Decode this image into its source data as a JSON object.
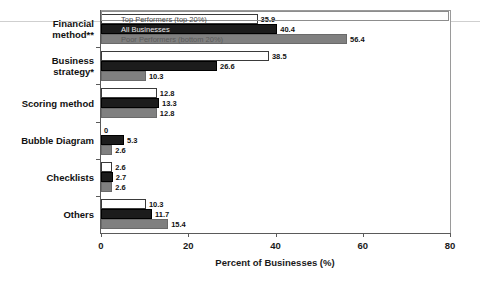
{
  "chart_data": {
    "type": "bar",
    "orientation": "horizontal",
    "title": "",
    "xlabel": "Percent of Businesses (%)",
    "ylabel": "",
    "xlim": [
      0,
      80
    ],
    "xticks": [
      "0",
      "20",
      "40",
      "60",
      "80"
    ],
    "grid": false,
    "legend_position": "inside-top-bars",
    "categories": [
      "Financial method**",
      "Business strategy*",
      "Scoring method",
      "Bubble Diagram",
      "Checklists",
      "Others"
    ],
    "series": [
      {
        "name": "Top Performers (top 20%)",
        "color": "#ffffff",
        "values": [
          35.9,
          38.5,
          12.8,
          0,
          2.6,
          10.3
        ],
        "value_labels": [
          "35.9",
          "38.5",
          "12.8",
          "0",
          "2.6",
          "10.3"
        ]
      },
      {
        "name": "All Businesses",
        "color": "#1c1c1c",
        "values": [
          40.4,
          26.6,
          13.3,
          5.3,
          2.7,
          11.7
        ],
        "value_labels": [
          "40.4",
          "26.6",
          "13.3",
          "5.3",
          "2.7",
          "11.7"
        ]
      },
      {
        "name": "Poor Performers (bottom 20%)",
        "color": "#808080",
        "values": [
          56.4,
          10.3,
          12.8,
          2.6,
          2.6,
          15.4
        ],
        "value_labels": [
          "56.4",
          "10.3",
          "12.8",
          "2.6",
          "2.6",
          "15.4"
        ]
      }
    ]
  },
  "legend": {
    "entries": [
      "Top Performers (top 20%)",
      "All Businesses",
      "Poor Performers (bottom 20%)"
    ]
  },
  "axis": {
    "x_title": "Percent of Businesses (%)",
    "x_tick_labels": [
      "0",
      "20",
      "40",
      "60",
      "80"
    ]
  },
  "colors": {
    "top_performers": "#ffffff",
    "all_businesses": "#1c1c1c",
    "poor_performers": "#808080",
    "axis": "#5a5a5a",
    "text": "#111111"
  }
}
